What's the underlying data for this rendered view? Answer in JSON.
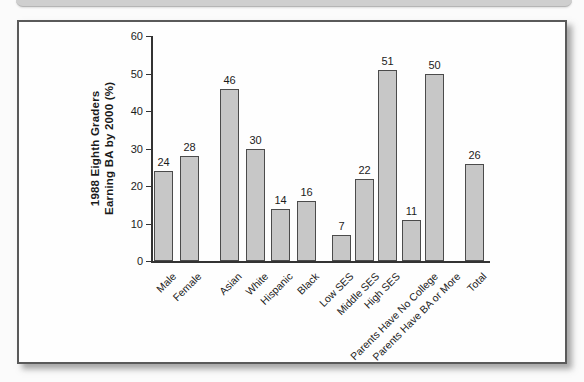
{
  "chart_data": {
    "type": "bar",
    "title": "",
    "categories": [
      "Male",
      "Female",
      "Asian",
      "White",
      "Hispanic",
      "Black",
      "Low SES",
      "Middle SES",
      "High SES",
      "Parents Have No College",
      "Parents Have BA or More",
      "Total"
    ],
    "values": [
      24,
      28,
      46,
      30,
      14,
      16,
      7,
      22,
      51,
      11,
      50,
      26
    ],
    "groups": [
      [
        0,
        1
      ],
      [
        2,
        3,
        4,
        5
      ],
      [
        6,
        7,
        8,
        9,
        10
      ],
      [
        11
      ]
    ],
    "ylabel": "1988 Eighth Graders Earning BA by 2000 (%)",
    "ylabel_lines": [
      "1988 Eighth Graders",
      "Earning BA by 2000 (%)"
    ],
    "xlabel": "",
    "ylim": [
      0,
      60
    ],
    "yticks": [
      0,
      10,
      20,
      30,
      40,
      50,
      60
    ],
    "grid": false,
    "legend": null,
    "bar_value_labels_shown": true,
    "x_labels_rotation_deg": 45,
    "colors": {
      "bar_fill": "#c7c7c7",
      "bar_border": "#4b4b4b",
      "axis": "#333333",
      "text": "#1c1c1c",
      "panel_background": "#fefefe",
      "panel_border": "#5a5a5a",
      "page_background": "#fbfbfb",
      "top_band": "#cfcfcf"
    }
  }
}
